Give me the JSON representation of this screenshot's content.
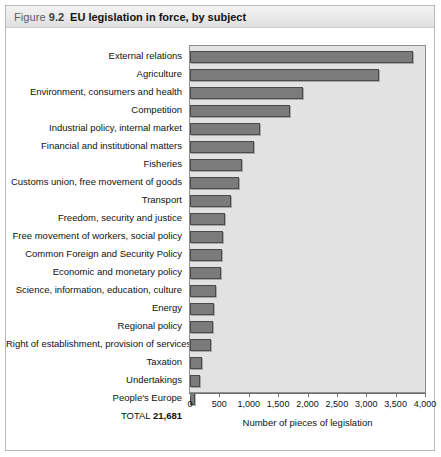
{
  "figure": {
    "label": "Figure",
    "number": "9.2",
    "title": "EU legislation in force, by subject"
  },
  "chart_data": {
    "type": "bar",
    "orientation": "horizontal",
    "title": "EU legislation in force, by subject",
    "xlabel": "Number of pieces of legislation",
    "ylabel": "",
    "xlim": [
      0,
      4000
    ],
    "xticks": [
      "0",
      "500",
      "1,000",
      "1,500",
      "2,000",
      "2,500",
      "3,000",
      "3,500",
      "4,000"
    ],
    "xtick_values": [
      0,
      500,
      1000,
      1500,
      2000,
      2500,
      3000,
      3500,
      4000
    ],
    "grid": false,
    "legend": null,
    "categories": [
      "External relations",
      "Agriculture",
      "Environment, consumers and health",
      "Competition",
      "Industrial policy, internal market",
      "Financial and institutional matters",
      "Fisheries",
      "Customs union, free movement of goods",
      "Transport",
      "Freedom, security and justice",
      "Free movement of workers, social policy",
      "Common Foreign and Security Policy",
      "Economic and monetary policy",
      "Science, information, education, culture",
      "Energy",
      "Regional policy",
      "Right of establishment, provision of services",
      "Taxation",
      "Undertakings",
      "People's Europe"
    ],
    "values": [
      3800,
      3220,
      1930,
      1710,
      1190,
      1085,
      880,
      840,
      690,
      600,
      560,
      540,
      520,
      440,
      410,
      390,
      360,
      200,
      170,
      85
    ],
    "total_label": "TOTAL",
    "total_value": "21,681",
    "bar_color": "#7b7b7b",
    "bar_border_color": "#4a4a4a",
    "plot_background": "#e2e2e2"
  }
}
